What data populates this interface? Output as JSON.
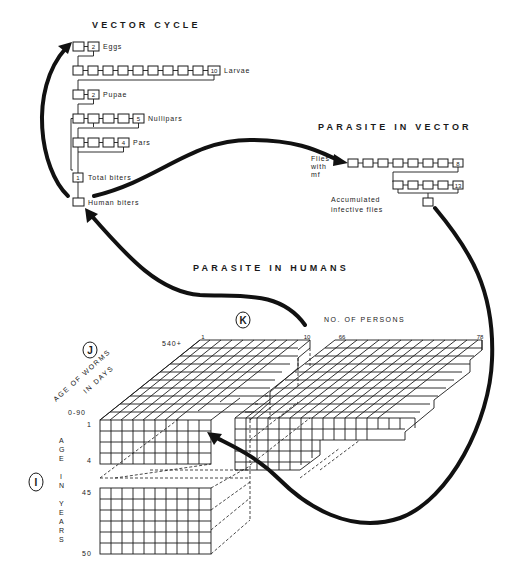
{
  "vector_cycle": {
    "title": "VECTOR CYCLE",
    "stages": [
      {
        "label": "Eggs",
        "count": "2"
      },
      {
        "label": "Larvae",
        "count": "10"
      },
      {
        "label": "Pupae",
        "count": "2"
      },
      {
        "label": "Nullipars",
        "count": "5"
      },
      {
        "label": "Pars",
        "count": "4"
      },
      {
        "label": "Total biters",
        "count": "1"
      },
      {
        "label": "Human biters",
        "count": ""
      }
    ]
  },
  "parasite_in_vector": {
    "title": "PARASITE IN VECTOR",
    "flies_label_1": "Flies",
    "flies_label_2": "with",
    "flies_label_3": "mf",
    "row1_count": "8",
    "row2_count": "13",
    "accumulated_label_1": "Accumulated",
    "accumulated_label_2": "infective flies"
  },
  "parasite_in_humans": {
    "title": "PARASITE IN HUMANS",
    "marker_k": "K",
    "marker_j": "J",
    "marker_i": "I",
    "persons_axis_label": "NO. OF PERSONS",
    "persons_ticks": [
      "1",
      "10",
      "66",
      "78"
    ],
    "worm_age_label_1": "AGE OF WORMS",
    "worm_age_label_2": "IN DAYS",
    "worm_age_ticks": [
      "540+",
      "0-90"
    ],
    "human_age_label": [
      "A",
      "G",
      "E",
      "",
      "I",
      "N",
      "",
      "Y",
      "E",
      "A",
      "R",
      "S"
    ],
    "human_age_ticks": [
      "1",
      "4",
      "45",
      "50"
    ]
  },
  "colors": {
    "ink": "#1a1a1a",
    "background": "#ffffff"
  }
}
